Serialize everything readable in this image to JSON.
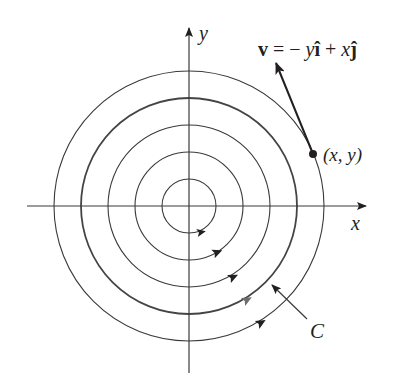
{
  "diagram": {
    "center": {
      "x": 189,
      "y": 206
    },
    "colors": {
      "ink": "#231f20",
      "axis": "#3a3a3a",
      "curve_c": "#555555",
      "arrow_gray": "#6d6d6d",
      "background": "#ffffff"
    },
    "axes": {
      "x_label": "x",
      "y_label": "y"
    },
    "circles": [
      {
        "radius": 27,
        "highlight": false
      },
      {
        "radius": 54,
        "highlight": false
      },
      {
        "radius": 81,
        "highlight": false
      },
      {
        "radius": 108,
        "highlight": true,
        "label": "C"
      },
      {
        "radius": 135,
        "highlight": false
      }
    ],
    "orientation": "counterclockwise",
    "point_label": "(x, y)",
    "vector_label": {
      "bold_v": "v",
      "eq": " = − ",
      "y": "y",
      "i_hat": "î",
      "plus": " + ",
      "x": "x",
      "j_hat": "ĵ"
    },
    "curve_label": "C"
  }
}
